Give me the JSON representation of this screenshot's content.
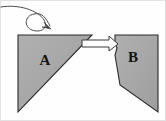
{
  "figure": {
    "background_color": "#fefefe",
    "border_color": "#d8d8d8"
  },
  "colors": {
    "shape_fill": "#a6a6a6",
    "shape_fill_light": "#b3b3b3",
    "shape_stroke": "#2b2b2b",
    "arrow_fill": "#fdfdfd",
    "arrow_stroke": "#3a3a3a",
    "curve_stroke": "#4a4a4a",
    "label_color": "#131313"
  },
  "shapes": [
    {
      "id": "shape-a",
      "label": "A",
      "kind": "right-triangle",
      "label_x": 45,
      "label_y": 61,
      "points": "18,35 92,35 18,112",
      "fill": "#a6a6a6",
      "stroke": "#2b2b2b"
    },
    {
      "id": "shape-b",
      "label": "B",
      "kind": "notched-quadrilateral",
      "label_x": 133,
      "label_y": 58,
      "points": "115,35 158,35 158,112 120,85 115,55 117,48 115,42",
      "fill": "#a6a6a6",
      "stroke": "#2b2b2b"
    }
  ],
  "connector_arrow": {
    "id": "separation-arrow",
    "description": "white block arrow pointing right from shape A tip to shape B notch",
    "direction": "right",
    "fill": "#fdfdfd",
    "stroke": "#3a3a3a",
    "tail_x": 82,
    "tip_x": 117,
    "center_y": 44
  },
  "motion_curve": {
    "id": "looping-motion-arrow",
    "description": "curved looping arrow entering from top-left, pointing down-right",
    "stroke": "#4a4a4a",
    "stroke_width": 1,
    "path": "M 1,7 C 18,4 38,10 44,20 C 49,29 40,33 32,30 C 24,27 24,16 34,14 C 42,12 46,18 50,26",
    "arrow_tip_x": 51,
    "arrow_tip_y": 28
  }
}
